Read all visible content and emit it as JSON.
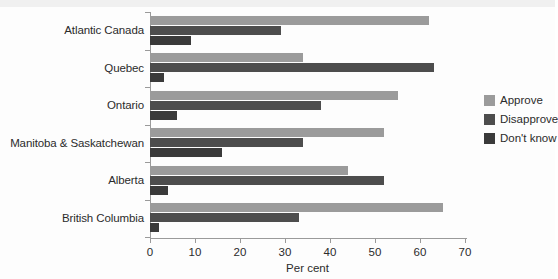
{
  "chart_data": {
    "type": "bar",
    "orientation": "horizontal",
    "title": "",
    "xlabel": "Per cent",
    "ylabel": "",
    "xlim": [
      0,
      70
    ],
    "xticks": [
      0,
      10,
      20,
      30,
      40,
      50,
      60,
      70
    ],
    "grid": false,
    "legend_position": "right",
    "categories": [
      "Atlantic Canada",
      "Quebec",
      "Ontario",
      "Manitoba & Saskatchewan",
      "Alberta",
      "British Columbia"
    ],
    "series": [
      {
        "name": "Approve",
        "color": "#9b9b9b",
        "values": [
          62,
          34,
          55,
          52,
          44,
          65
        ]
      },
      {
        "name": "Disapprove",
        "color": "#4d4d4d",
        "values": [
          29,
          63,
          38,
          34,
          52,
          33
        ]
      },
      {
        "name": "Don't know",
        "color": "#3a3a3a",
        "values": [
          9,
          3,
          6,
          16,
          4,
          2
        ]
      }
    ]
  },
  "axis": {
    "x_label": "Per cent",
    "tick_labels": [
      "0",
      "10",
      "20",
      "30",
      "40",
      "50",
      "60",
      "70"
    ]
  },
  "legend": {
    "items": [
      {
        "label": "Approve",
        "color": "#9b9b9b"
      },
      {
        "label": "Disapprove",
        "color": "#4d4d4d"
      },
      {
        "label": "Don't know",
        "color": "#3a3a3a"
      }
    ]
  }
}
